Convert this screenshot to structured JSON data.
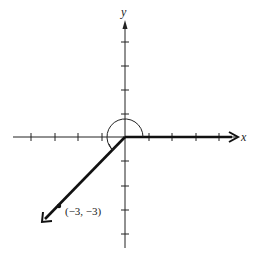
{
  "diagram": {
    "type": "coordinate-plane-angle",
    "axes": {
      "x_label": "x",
      "y_label": "y",
      "origin_px": [
        125,
        137
      ],
      "unit_px": 23.5,
      "x_ticks": [
        -4,
        -3,
        -2,
        -1,
        1,
        2,
        3,
        4
      ],
      "y_ticks": [
        4,
        3,
        2,
        1,
        -1,
        -2,
        -3,
        -4
      ]
    },
    "initial_side": {
      "direction": "positive x-axis",
      "style": "bold ray"
    },
    "terminal_side": {
      "through_point": [
        -3,
        -3
      ],
      "style": "bold ray"
    },
    "point": {
      "label": "(−3, −3)",
      "x": -3,
      "y": -3
    },
    "angle_arc": {
      "direction": "counterclockwise",
      "from_deg": 0,
      "to_deg": 225
    },
    "colors": {
      "ink": "#111111",
      "background": "#ffffff"
    }
  }
}
